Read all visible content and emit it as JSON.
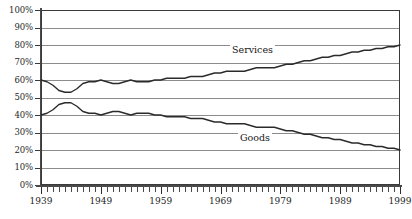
{
  "chart_data": {
    "type": "line",
    "title": "",
    "xlabel": "",
    "ylabel": "",
    "xlim": [
      1939,
      1999
    ],
    "ylim": [
      0,
      100
    ],
    "grid": true,
    "legend": "inline-labels",
    "y_ticks": [
      "100%",
      "90%",
      "80%",
      "70%",
      "60%",
      "50%",
      "40%",
      "30%",
      "20%",
      "10%",
      "0%"
    ],
    "y_tick_values": [
      100,
      90,
      80,
      70,
      60,
      50,
      40,
      30,
      20,
      10,
      0
    ],
    "x_ticks": [
      "1939",
      "1949",
      "1959",
      "1969",
      "1979",
      "1989",
      "1999"
    ],
    "x_tick_values": [
      1939,
      1949,
      1959,
      1969,
      1979,
      1989,
      1999
    ],
    "x_minor_tick_interval": 1,
    "units": "percent",
    "x": [
      1939,
      1940,
      1941,
      1942,
      1943,
      1944,
      1945,
      1946,
      1947,
      1948,
      1949,
      1950,
      1951,
      1952,
      1953,
      1954,
      1955,
      1956,
      1957,
      1958,
      1959,
      1960,
      1961,
      1962,
      1963,
      1964,
      1965,
      1966,
      1967,
      1968,
      1969,
      1970,
      1971,
      1972,
      1973,
      1974,
      1975,
      1976,
      1977,
      1978,
      1979,
      1980,
      1981,
      1982,
      1983,
      1984,
      1985,
      1986,
      1987,
      1988,
      1989,
      1990,
      1991,
      1992,
      1993,
      1994,
      1995,
      1996,
      1997,
      1998,
      1999
    ],
    "series": [
      {
        "name": "Services",
        "color": "#2b2b2b",
        "values": [
          60,
          59,
          57,
          54,
          53,
          53,
          55,
          58,
          59,
          59,
          60,
          59,
          58,
          58,
          59,
          60,
          59,
          59,
          59,
          60,
          60,
          61,
          61,
          61,
          61,
          62,
          62,
          62,
          63,
          64,
          64,
          65,
          65,
          65,
          65,
          66,
          67,
          67,
          67,
          67,
          68,
          69,
          69,
          70,
          71,
          71,
          72,
          73,
          73,
          74,
          74,
          75,
          76,
          76,
          77,
          77,
          78,
          78,
          79,
          79,
          80
        ]
      },
      {
        "name": "Goods",
        "color": "#2b2b2b",
        "values": [
          40,
          41,
          43,
          46,
          47,
          47,
          45,
          42,
          41,
          41,
          40,
          41,
          42,
          42,
          41,
          40,
          41,
          41,
          41,
          40,
          40,
          39,
          39,
          39,
          39,
          38,
          38,
          38,
          37,
          36,
          36,
          35,
          35,
          35,
          35,
          34,
          33,
          33,
          33,
          33,
          32,
          31,
          31,
          30,
          29,
          29,
          28,
          27,
          27,
          26,
          26,
          25,
          24,
          24,
          23,
          23,
          22,
          22,
          21,
          21,
          20
        ]
      }
    ],
    "annotations": [
      {
        "text": "Services",
        "series": "Services",
        "x": 1969,
        "y": 72
      },
      {
        "text": "Goods",
        "series": "Goods",
        "x": 1970,
        "y": 30
      }
    ]
  },
  "caption": {
    "text": ""
  }
}
